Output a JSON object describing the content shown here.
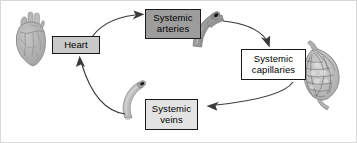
{
  "figure": {
    "background_color": "#ffffff",
    "border_color": "#d8d8d8"
  },
  "nodes": [
    {
      "id": "heart",
      "label": "Heart",
      "label_line1": "Heart",
      "label_line2": "",
      "fill": "#c9c9c9",
      "stroke": "#1a1a1a"
    },
    {
      "id": "systemic-arteries",
      "label": "Systemic arteries",
      "label_line1": "Systemic",
      "label_line2": "arteries",
      "fill": "#9d9d9d",
      "stroke": "#1a1a1a"
    },
    {
      "id": "systemic-capillaries",
      "label": "Systemic capillaries",
      "label_line1": "Systemic",
      "label_line2": "capillaries",
      "fill": "#ffffff",
      "stroke": "#1a1a1a"
    },
    {
      "id": "systemic-veins",
      "label": "Systemic veins",
      "label_line1": "Systemic",
      "label_line2": "veins",
      "fill": "#e3e3e3",
      "stroke": "#1a1a1a"
    }
  ],
  "illustrations": [
    {
      "id": "heart-organ",
      "name": "heart-illustration",
      "fill": "#b0b0b0"
    },
    {
      "id": "artery-vessel",
      "name": "artery-vessel-illustration",
      "fill": "#9a9a9a"
    },
    {
      "id": "capillary-bed",
      "name": "capillary-bed-illustration",
      "fill": "#bdbdbd"
    },
    {
      "id": "vein-vessel",
      "name": "vein-vessel-illustration",
      "fill": "#c2c2c2"
    }
  ],
  "arrows": [
    {
      "id": "heart-to-arteries",
      "from": "heart",
      "to": "systemic-arteries",
      "color": "#3a3a3a"
    },
    {
      "id": "arteries-to-capillaries",
      "from": "systemic-arteries",
      "to": "systemic-capillaries",
      "color": "#3a3a3a"
    },
    {
      "id": "capillaries-to-veins",
      "from": "systemic-capillaries",
      "to": "systemic-veins",
      "color": "#3a3a3a"
    },
    {
      "id": "veins-to-heart",
      "from": "systemic-veins",
      "to": "heart",
      "color": "#3a3a3a"
    }
  ]
}
